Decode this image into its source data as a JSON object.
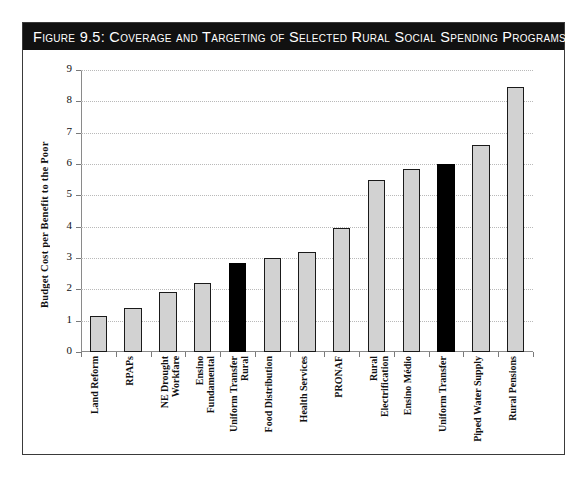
{
  "figure": {
    "title": "Figure 9.5:  Coverage and Targeting of Selected Rural Social Spending Programs"
  },
  "chart_data": {
    "type": "bar",
    "title": "Figure 9.5:  Coverage and Targeting of Selected Rural Social Spending Programs",
    "xlabel": "",
    "ylabel": "Budget Cost per Benefit to the Poor",
    "ylim": [
      0,
      9
    ],
    "yticks": [
      0,
      1,
      2,
      3,
      4,
      5,
      6,
      7,
      8,
      9
    ],
    "ytick_labels": [
      "0",
      "1",
      "2",
      "3",
      "4",
      "5",
      "6",
      "7",
      "8",
      "9"
    ],
    "grid": true,
    "legend": "none",
    "categories": [
      "Land Reform",
      "RPAPs",
      "NE Drought Workfare",
      "Ensino Fundamental",
      "Uniform Transfer Rural",
      "Food Distribution",
      "Health Services",
      "PRONAF",
      "Rural Electrification",
      "Ensino Médio",
      "Uniform Transfer",
      "Piped Water Supply",
      "Rural Pensions"
    ],
    "category_lines": [
      [
        "Land Reform"
      ],
      [
        "RPAPs"
      ],
      [
        "NE Drought",
        "Workfare"
      ],
      [
        "Ensino",
        "Fundamental"
      ],
      [
        "Uniform Transfer",
        "Rural"
      ],
      [
        "Food Distribution"
      ],
      [
        "Health Services"
      ],
      [
        "PRONAF"
      ],
      [
        "Rural",
        "Electrification"
      ],
      [
        "Ensino Médio"
      ],
      [
        "Uniform Transfer"
      ],
      [
        "Piped Water Supply"
      ],
      [
        "Rural Pensions"
      ]
    ],
    "values": [
      1.15,
      1.4,
      1.9,
      2.2,
      2.85,
      3.0,
      3.2,
      3.95,
      5.5,
      5.85,
      6.0,
      6.6,
      8.45
    ],
    "bar_colors": [
      "#d2d2d2",
      "#d2d2d2",
      "#d2d2d2",
      "#d2d2d2",
      "#000000",
      "#d2d2d2",
      "#d2d2d2",
      "#d2d2d2",
      "#d2d2d2",
      "#d2d2d2",
      "#000000",
      "#d2d2d2",
      "#d2d2d2"
    ],
    "highlighted_categories": [
      "Uniform Transfer Rural",
      "Uniform Transfer"
    ],
    "colors": {
      "bar_light": "#d2d2d2",
      "bar_dark": "#000000",
      "bar_border": "#1a1a1a",
      "axis": "#8a8a8a",
      "grid": "#b9b9b9",
      "title_bar_background": "#111111",
      "title_text": "#ffffff",
      "frame_border": "#3a3a3a"
    }
  }
}
